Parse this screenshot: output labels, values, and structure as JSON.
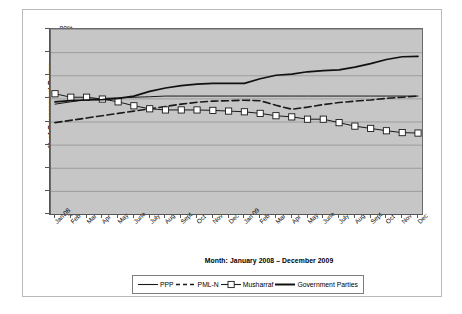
{
  "chart_data": {
    "type": "line",
    "title": "",
    "xlabel": "Month: January 2008 – December 2009",
    "ylabel": "% of Government Power",
    "ylim": [
      0,
      80
    ],
    "ytick_labels": [
      "80%",
      "70%",
      "60%",
      "50%",
      "40%",
      "30%",
      "20%",
      "10%",
      "0%"
    ],
    "ytick_values": [
      80,
      70,
      60,
      50,
      40,
      30,
      20,
      10,
      0
    ],
    "grid": true,
    "legend_position": "bottom",
    "categories": [
      "Jan 08",
      "Feb",
      "Mar",
      "Apr",
      "May",
      "June",
      "July",
      "Aug",
      "Sept",
      "Oct",
      "Nov",
      "Dec",
      "Jan 09",
      "Feb",
      "Mar",
      "Apr",
      "May",
      "June",
      "July",
      "Aug",
      "Sept",
      "Oct",
      "Nov",
      "Dec"
    ],
    "series": [
      {
        "name": "PPP",
        "style": "solid-thin",
        "color": "#1a1a1a",
        "marker": "none",
        "values": [
          47.5,
          48.5,
          49.5,
          50.0,
          50.2,
          50.5,
          50.7,
          51.0,
          51.0,
          51.0,
          51.0,
          51.0,
          51.0,
          51.0,
          51.0,
          51.0,
          51.0,
          51.0,
          51.0,
          51.0,
          51.0,
          51.0,
          51.0,
          51.0
        ]
      },
      {
        "name": "PML-N",
        "style": "dashed",
        "color": "#1a1a1a",
        "marker": "none",
        "values": [
          39.5,
          40.5,
          41.5,
          42.5,
          43.5,
          44.5,
          45.5,
          46.5,
          47.5,
          48.3,
          48.8,
          49.0,
          49.2,
          49.0,
          47.0,
          45.3,
          46.2,
          47.3,
          48.2,
          48.8,
          49.3,
          50.0,
          50.5,
          51.0
        ]
      },
      {
        "name": "Musharraf",
        "style": "solid-marker",
        "color": "#1a1a1a",
        "marker": "square-open",
        "values": [
          52.0,
          50.5,
          50.5,
          49.7,
          48.5,
          46.8,
          45.5,
          45.0,
          45.0,
          45.0,
          44.8,
          44.5,
          44.2,
          43.5,
          42.5,
          42.0,
          41.0,
          41.0,
          39.5,
          38.0,
          37.0,
          36.0,
          35.2,
          35.0
        ]
      },
      {
        "name": "Government Parties",
        "style": "solid-thick",
        "color": "#111111",
        "marker": "none",
        "values": [
          48.5,
          49.0,
          49.3,
          49.5,
          50.0,
          51.0,
          53.0,
          54.5,
          55.5,
          56.2,
          56.5,
          56.5,
          56.5,
          58.5,
          60.0,
          60.5,
          61.5,
          62.0,
          62.3,
          63.5,
          65.0,
          66.8,
          68.0,
          68.2
        ]
      }
    ]
  },
  "legend": {
    "items": [
      {
        "label": "PPP",
        "style": "solid-thin"
      },
      {
        "label": "PML-N",
        "style": "dashed"
      },
      {
        "label": "Musharraf",
        "style": "solid-marker"
      },
      {
        "label": "Government Parties",
        "style": "solid-thick"
      }
    ]
  }
}
